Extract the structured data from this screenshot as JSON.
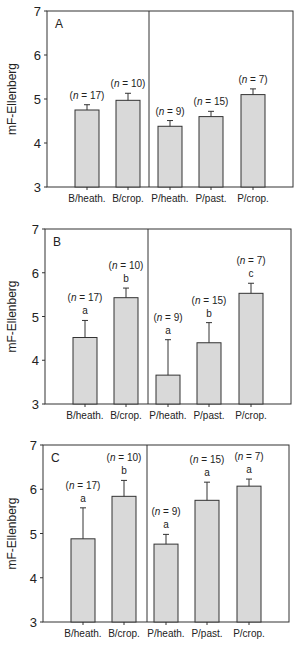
{
  "chart_data": [
    {
      "type": "bar",
      "panel": "A",
      "ylabel": "mF-Ellenberg",
      "ylim": [
        3,
        7
      ],
      "yticks": [
        3,
        4,
        5,
        6,
        7
      ],
      "categories": [
        "B/heath.",
        "B/crop.",
        "P/heath.",
        "P/past.",
        "P/crop."
      ],
      "values": [
        4.75,
        4.97,
        4.38,
        4.6,
        5.1
      ],
      "errors": [
        0.12,
        0.16,
        0.13,
        0.12,
        0.13
      ],
      "n_labels": [
        "(n = 17)",
        "(n = 10)",
        "(n = 9)",
        "(n = 15)",
        "(n = 7)"
      ],
      "significance": [
        "",
        "",
        "",
        "",
        ""
      ],
      "grid": false
    },
    {
      "type": "bar",
      "panel": "B",
      "ylabel": "mF-Ellenberg",
      "ylim": [
        3,
        7
      ],
      "yticks": [
        3,
        4,
        5,
        6,
        7
      ],
      "categories": [
        "B/heath.",
        "B/crop.",
        "P/heath.",
        "P/past.",
        "P/crop."
      ],
      "values": [
        4.52,
        5.43,
        3.66,
        4.4,
        5.53
      ],
      "errors": [
        0.39,
        0.22,
        0.81,
        0.46,
        0.23
      ],
      "n_labels": [
        "(n = 17)",
        "(n = 10)",
        "(n = 9)",
        "(n = 15)",
        "(n = 7)"
      ],
      "significance": [
        "a",
        "b",
        "a",
        "b",
        "c"
      ],
      "grid": false
    },
    {
      "type": "bar",
      "panel": "C",
      "ylabel": "mF-Ellenberg",
      "ylim": [
        3,
        7
      ],
      "yticks": [
        3,
        4,
        5,
        6,
        7
      ],
      "categories": [
        "B/heath.",
        "B/crop.",
        "P/heath.",
        "P/past.",
        "P/crop."
      ],
      "values": [
        4.88,
        5.84,
        4.76,
        5.75,
        6.07
      ],
      "errors": [
        0.7,
        0.36,
        0.22,
        0.41,
        0.16
      ],
      "n_labels": [
        "(n = 17)",
        "(n = 10)",
        "(n = 9)",
        "(n = 15)",
        "(n = 7)"
      ],
      "significance": [
        "a",
        "b",
        "a",
        "a",
        "a"
      ],
      "grid": false
    }
  ],
  "style": {
    "bar_fill": "#d9d9d9",
    "bar_stroke": "#333333",
    "axis_color": "#333333"
  }
}
